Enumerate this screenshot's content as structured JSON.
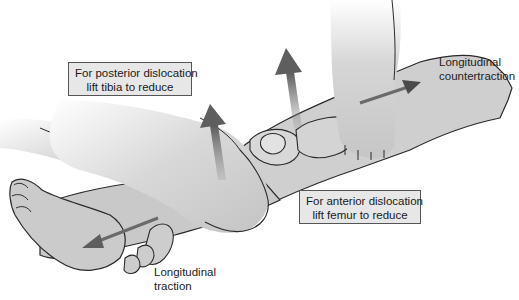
{
  "figure": {
    "colors": {
      "skin": "#c9c9c9",
      "skin_light": "#e4e4e4",
      "outline": "#2a2a2a",
      "arrow": "#5e5e5e",
      "box_fill": "#e7e7e7",
      "box_border": "#555555"
    },
    "callouts": {
      "posterior": {
        "line1": "For posterior dislocation",
        "line2": "lift tibia to reduce"
      },
      "anterior": {
        "line1": "For anterior dislocation",
        "line2": "lift femur to reduce"
      }
    },
    "labels": {
      "countertraction": {
        "line1": "Longitudinal",
        "line2": "countertraction"
      },
      "traction": {
        "line1": "Longitudinal",
        "line2": "traction"
      }
    },
    "arrows": [
      {
        "name": "traction-arrow",
        "direction": "down-left"
      },
      {
        "name": "lift-tibia-arrow",
        "direction": "up"
      },
      {
        "name": "lift-femur-arrow",
        "direction": "up"
      },
      {
        "name": "countertraction-arrow",
        "direction": "right"
      }
    ]
  }
}
